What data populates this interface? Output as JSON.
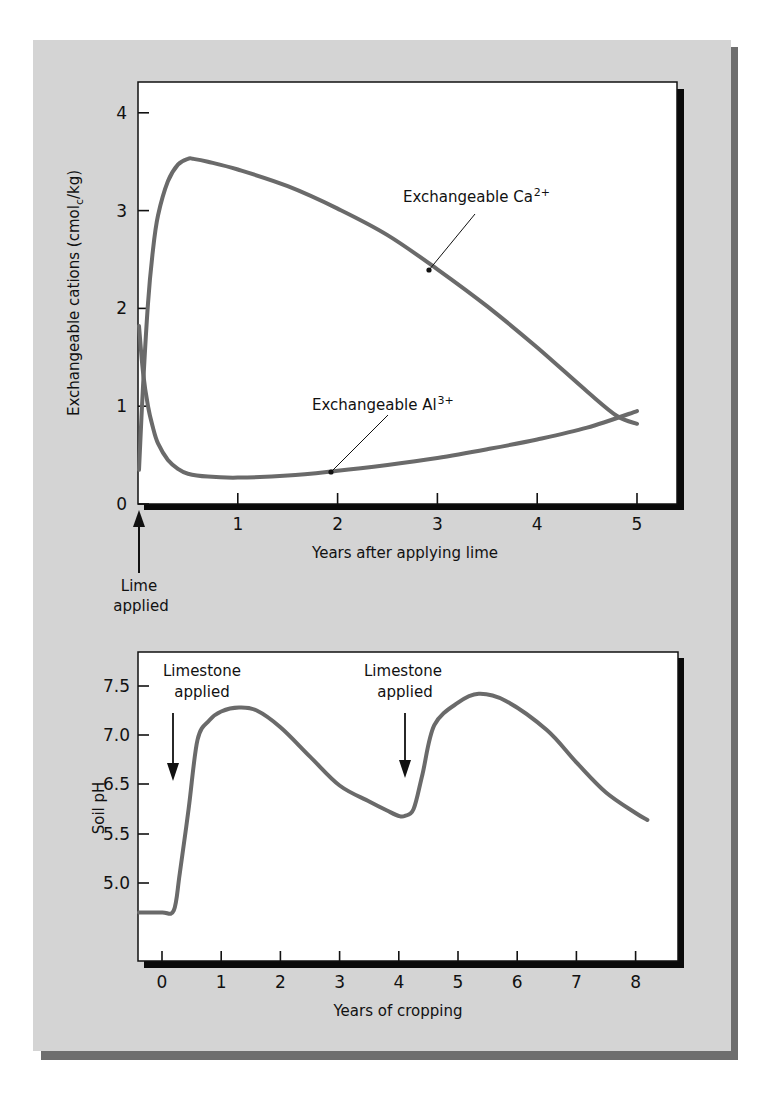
{
  "chart_data": [
    {
      "type": "line",
      "title": "",
      "xlabel": "Years after applying lime",
      "ylabel": "Exchangeable cations (cmol_c/kg)",
      "ylabel_parts": [
        "Exchangeable cations (cmol",
        "c",
        "/kg)"
      ],
      "xlim": [
        0,
        5.4
      ],
      "ylim": [
        0,
        4.3
      ],
      "x_ticks": [
        0,
        1,
        2,
        3,
        4,
        5
      ],
      "x_tick_labels": [
        "",
        "1",
        "2",
        "3",
        "4",
        "5"
      ],
      "y_ticks": [
        0,
        1,
        2,
        3,
        4
      ],
      "y_tick_labels": [
        "0",
        "1",
        "2",
        "3",
        "4"
      ],
      "grid": false,
      "legend": null,
      "series": [
        {
          "name": "Exchangeable Ca2+",
          "label": "Exchangeable Ca",
          "label_sup": "2+",
          "x": [
            0.01,
            0.05,
            0.1,
            0.15,
            0.2,
            0.3,
            0.4,
            0.5,
            0.55,
            0.7,
            1.0,
            1.5,
            2.0,
            2.5,
            3.0,
            3.5,
            4.0,
            4.5,
            4.8,
            5.0
          ],
          "values": [
            0.35,
            1.2,
            2.05,
            2.6,
            2.95,
            3.3,
            3.47,
            3.53,
            3.53,
            3.5,
            3.42,
            3.25,
            3.02,
            2.75,
            2.4,
            2.02,
            1.6,
            1.15,
            0.9,
            0.82
          ]
        },
        {
          "name": "Exchangeable Al3+",
          "label": "Exchangeable Al",
          "label_sup": "3+",
          "x": [
            0.01,
            0.05,
            0.1,
            0.15,
            0.2,
            0.3,
            0.4,
            0.5,
            0.7,
            1.0,
            1.5,
            2.0,
            2.5,
            3.0,
            3.5,
            4.0,
            4.5,
            5.0
          ],
          "values": [
            1.82,
            1.35,
            1.0,
            0.78,
            0.62,
            0.45,
            0.36,
            0.31,
            0.28,
            0.27,
            0.29,
            0.34,
            0.4,
            0.47,
            0.56,
            0.66,
            0.78,
            0.95
          ]
        }
      ],
      "annotations": [
        {
          "text": "Exchangeable Ca",
          "sup": "2+",
          "point": [
            2.93,
            2.4
          ],
          "text_pos": [
            3.6,
            3.14
          ]
        },
        {
          "text": "Exchangeable Al",
          "sup": "3+",
          "point": [
            1.93,
            0.33
          ],
          "text_pos": [
            2.5,
            1.0
          ]
        },
        {
          "text_lines": [
            "Lime",
            "applied"
          ],
          "arrow_at_x": 0
        }
      ]
    },
    {
      "type": "line",
      "title": "",
      "xlabel": "Years of cropping",
      "ylabel": "Soil pH",
      "xlim": [
        -0.4,
        8.7
      ],
      "x_ticks": [
        0,
        1,
        2,
        3,
        4,
        5,
        6,
        7,
        8
      ],
      "x_tick_labels": [
        "0",
        "1",
        "2",
        "3",
        "4",
        "5",
        "6",
        "7",
        "8"
      ],
      "y_ticks": [
        7.5,
        7.0,
        6.5,
        5.5,
        5.0
      ],
      "y_tick_labels": [
        "7.5",
        "7.0",
        "6.5",
        "5.5",
        "5.0"
      ],
      "grid": false,
      "legend": null,
      "series": [
        {
          "name": "Soil pH",
          "x": [
            -0.4,
            0.0,
            0.2,
            0.3,
            0.45,
            0.6,
            0.8,
            1.0,
            1.3,
            1.6,
            2.0,
            2.5,
            3.0,
            3.5,
            3.8,
            4.0,
            4.1,
            4.25,
            4.4,
            4.6,
            5.0,
            5.35,
            5.8,
            6.5,
            7.0,
            7.5,
            8.0,
            8.2
          ],
          "values": [
            4.7,
            4.7,
            4.72,
            5.1,
            6.0,
            6.95,
            7.15,
            7.24,
            7.28,
            7.25,
            7.08,
            6.78,
            6.47,
            6.15,
            5.97,
            5.86,
            5.86,
            6.0,
            6.6,
            7.1,
            7.33,
            7.42,
            7.35,
            7.05,
            6.72,
            6.33,
            5.92,
            5.78
          ]
        }
      ],
      "annotations": [
        {
          "text_lines": [
            "Limestone",
            "applied"
          ],
          "arrow_at_x": 0.2
        },
        {
          "text_lines": [
            "Limestone",
            "applied"
          ],
          "arrow_at_x": 4.2
        }
      ]
    }
  ],
  "colors": {
    "panel": "#d4d4d4",
    "panel_shadow": "#6e6e6e",
    "plot_bg": "#ffffff",
    "curve": "#6a6a6a",
    "axis": "#111111"
  }
}
